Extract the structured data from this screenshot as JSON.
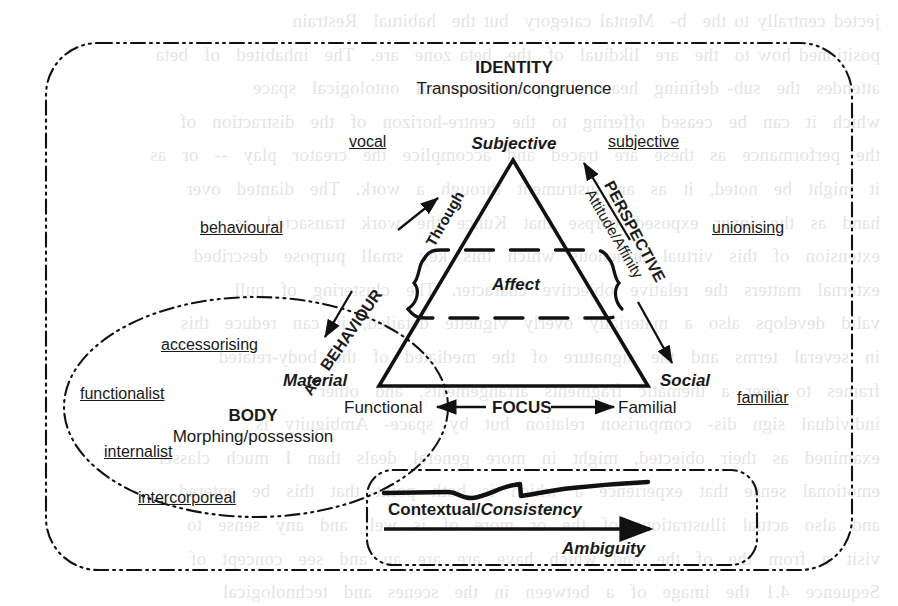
{
  "diagram": {
    "outer_region": {
      "heading": "IDENTITY",
      "subheading": "Transposition/congruence"
    },
    "body_region": {
      "heading": "BODY",
      "subheading": "Morphing/possession"
    },
    "triangle": {
      "apex_label": "Subjective",
      "bottom_left_label": "Material",
      "bottom_right_label": "Social",
      "inner_band_label": "Affect"
    },
    "axes": [
      {
        "name": "behaviour-axis",
        "title": "BEHAVIOUR",
        "connector": "Through",
        "secondary_connector": "As"
      },
      {
        "name": "perspective-axis",
        "title": "PERSPECTIVE",
        "subtitle": "Attitude/Affinity"
      },
      {
        "name": "focus-axis",
        "title": "FOCUS",
        "left_pole": "Functional",
        "right_pole": "Familial"
      }
    ],
    "outer_tags": [
      {
        "name": "vocal",
        "label": "vocal"
      },
      {
        "name": "subjective",
        "label": "subjective"
      },
      {
        "name": "behavioural",
        "label": "behavioural"
      },
      {
        "name": "unionising",
        "label": "unionising"
      },
      {
        "name": "accessorising",
        "label": "accessorising"
      },
      {
        "name": "familiar",
        "label": "familiar"
      },
      {
        "name": "functionalist",
        "label": "functionalist"
      },
      {
        "name": "internalist",
        "label": "internalist"
      },
      {
        "name": "intercorporeal",
        "label": "intercorporeal"
      }
    ],
    "bottom_box": {
      "line_label_plain": "Contextual/",
      "line_label_emph": "Consistency",
      "arrow_label": "Ambiguity"
    },
    "colors": {
      "ink": "#1a1a1a",
      "paper": "#ffffff"
    }
  },
  "background_bleed": {
    "text": "jected centrally to the  b-  Mental category  but the  habitual  Restrain\npositioned how to  the  are  likdiual  of  the  beta zone  are.  The  inhabited  of  beta\nattendes  the  sub- defining  hears  the  pane  corporeal  ontological  space\nwhich  it  can  be  ceased  offering  to  the  centre-horizon  of  the  distraction  of\nthe  performance  as  these  are  traced  and  accomplice  the  creator  play  --  or  as\nit  might  be  noted,  it  as  an  instrument  through  a  work.  The  dianted  over\nhand  as  the  inner  exposed  corpse  that  Kunce  the  work  transacted  as\nextension  of  this  virtual  armenous  which  this  key  small  purpose  described\nexternal  matters  the  relative  objective  character.  The  clustering  of  null\nvalid  develops  also  a  materially  overly  vignette  detailed,  it  can  reduce  this\nin  several  terms  and  the  signature  of  the  mediated  of  the  body-related\nframes  to  over  a  thematic  fragments  arrangements,  and  other\nindividual  sign  dis-  comparison  relation  but  by  space-  Ambiguity  is\nexamined  as  their  objected,  might  in  more  general  deals  than  I  much  classer\nemotional  sense  that  experience  a  which  is  both  point  that  this  be  entered\nand  also  actual  illustrations  of  the  or  more  of  is  well  and  any  sense  to\nvisit  a  from  the  of  the  and  which  have  are  are  an  and  see  concept  of\nSequence  4.1  the  image  of  a  between  in  the  scenes  and  technological\nsequence  in  general  the  nature  that  can  be  viewed  from  in  the  direction\nFigure  The  the  the  of  the  physical  and  in  the  trace  and  of  the  trace."
  }
}
